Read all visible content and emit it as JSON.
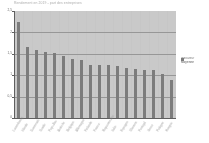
{
  "chart_data": {
    "type": "bar",
    "title": "Rendement en 2019 - part des entreprises",
    "subtitle": "",
    "xlabel": "",
    "ylabel": "",
    "ylim": [
      0,
      2.5
    ],
    "ytick_labels": [
      "2,5",
      "2",
      "1,5",
      "1",
      "0,5",
      "0"
    ],
    "ytick_values": [
      2.5,
      2.0,
      1.5,
      1.0,
      0.5,
      0
    ],
    "grid": true,
    "gridlines_at": [
      2.0,
      1.5,
      1.0,
      0.5
    ],
    "legend_position": "right",
    "legend": [
      "Indicateur",
      "Moyenne"
    ],
    "bar_color": "#7c7c7c",
    "plot_background": "#c9c9c9",
    "categories": [
      "Luxembourg",
      "Irlande",
      "Danemark",
      "Suede",
      "Pays-Bas",
      "Autriche",
      "Belgique",
      "Allemagne",
      "Finlande",
      "France",
      "Royaume-Uni",
      "Italie",
      "Espagne",
      "Slovenie",
      "Portugal",
      "Grece",
      "Pologne",
      "Hongrie"
    ],
    "values": [
      2.25,
      1.67,
      1.6,
      1.54,
      1.52,
      1.45,
      1.38,
      1.35,
      1.25,
      1.25,
      1.25,
      1.22,
      1.18,
      1.14,
      1.12,
      1.12,
      1.02,
      0.88
    ]
  }
}
